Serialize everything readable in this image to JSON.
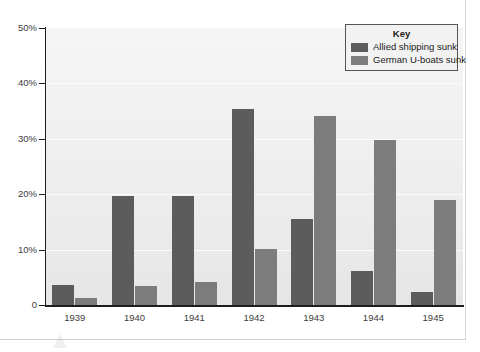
{
  "chart_data": {
    "type": "bar",
    "title": "",
    "xlabel": "",
    "ylabel": "",
    "categories": [
      "1939",
      "1940",
      "1941",
      "1942",
      "1943",
      "1944",
      "1945"
    ],
    "series": [
      {
        "name": "Allied shipping sunk",
        "color": "#5c5c5c",
        "values": [
          3.7,
          19.6,
          19.6,
          35.3,
          15.5,
          6.2,
          2.3
        ]
      },
      {
        "name": "German U-boats sunk",
        "color": "#7c7c7c",
        "values": [
          1.3,
          3.4,
          4.1,
          10.2,
          34.2,
          29.8,
          19.0
        ]
      }
    ],
    "ylim": [
      0,
      50
    ],
    "y_ticks": [
      "0",
      "10%",
      "20%",
      "30%",
      "40%",
      "50%"
    ],
    "y_tick_values": [
      0,
      10,
      20,
      30,
      40,
      50
    ],
    "grid": true,
    "legend_position": "top-right"
  },
  "legend": {
    "title": "Key",
    "entries": [
      {
        "label": "Allied shipping sunk",
        "color": "#5c5c5c"
      },
      {
        "label": "German U-boats sunk",
        "color": "#7c7c7c"
      }
    ]
  }
}
